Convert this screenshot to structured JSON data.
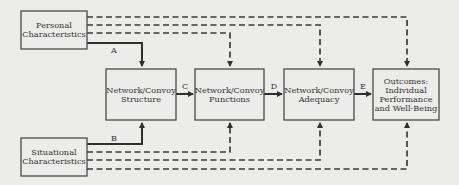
{
  "diagram": {
    "nodes": {
      "personal": [
        "Personal",
        "Characteristics"
      ],
      "situational": [
        "Situational",
        "Characteristics"
      ],
      "structure": [
        "Network/Convoy",
        "Structure"
      ],
      "functions": [
        "Network/Convoy",
        "Functions"
      ],
      "adequacy": [
        "Network/Convoy",
        "Adequacy"
      ],
      "outcomes": [
        "Outcomes:",
        "Individual",
        "Performance",
        "and Well-Being"
      ]
    },
    "edge_labels": {
      "a": "A",
      "b": "B",
      "c": "C",
      "d": "D",
      "e": "E"
    },
    "edges": [
      {
        "from": "personal",
        "to": "structure",
        "label": "A",
        "style": "solid"
      },
      {
        "from": "situational",
        "to": "structure",
        "label": "B",
        "style": "solid"
      },
      {
        "from": "structure",
        "to": "functions",
        "label": "C",
        "style": "solid"
      },
      {
        "from": "functions",
        "to": "adequacy",
        "label": "D",
        "style": "solid"
      },
      {
        "from": "adequacy",
        "to": "outcomes",
        "label": "E",
        "style": "solid"
      },
      {
        "from": "personal",
        "to": "functions",
        "style": "dashed"
      },
      {
        "from": "personal",
        "to": "adequacy",
        "style": "dashed"
      },
      {
        "from": "personal",
        "to": "outcomes",
        "style": "dashed"
      },
      {
        "from": "situational",
        "to": "functions",
        "style": "dashed"
      },
      {
        "from": "situational",
        "to": "adequacy",
        "style": "dashed"
      },
      {
        "from": "situational",
        "to": "outcomes",
        "style": "dashed"
      }
    ]
  }
}
